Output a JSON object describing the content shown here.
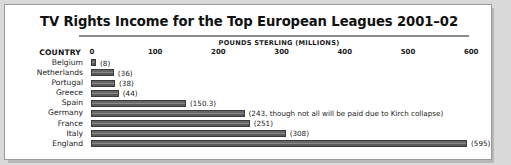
{
  "chart_data": {
    "type": "bar",
    "orientation": "horizontal",
    "title": "TV Rights Income for the Top European Leagues 2001–02",
    "xlabel": "POUNDS STERLING (MILLIONS)",
    "ylabel": "COUNTRY",
    "xlim": [
      0,
      620
    ],
    "xticks": [
      0,
      100,
      200,
      300,
      400,
      500,
      600
    ],
    "xticklabels": [
      "0",
      "100",
      "200",
      "300",
      "400",
      "500",
      "600"
    ],
    "grid": false,
    "legend": null,
    "categories": [
      "Belgium",
      "Netherlands",
      "Portugal",
      "Greece",
      "Spain",
      "Germany",
      "France",
      "Italy",
      "England"
    ],
    "values": [
      8,
      36,
      38,
      44,
      150.3,
      243,
      251,
      308,
      595
    ],
    "data_labels": [
      "(8)",
      "(36)",
      "(38)",
      "(44)",
      "(150.3)",
      "(243, though not all will be paid due to Kirch collapse)",
      "(251)",
      "(308)",
      "(595)"
    ],
    "annotations": [
      {
        "category": "Germany",
        "text": "though not all will be paid due to Kirch collapse"
      }
    ],
    "colors": {
      "bar_fill": "#5f5f5f",
      "bar_edge": "#3b3b3b",
      "panel_background": "#ffffff",
      "outer_background": "#d9d9d9",
      "frame_border": "#9a9a9a",
      "rule": "#8d8d8d",
      "text": "#1a1a1a"
    }
  }
}
